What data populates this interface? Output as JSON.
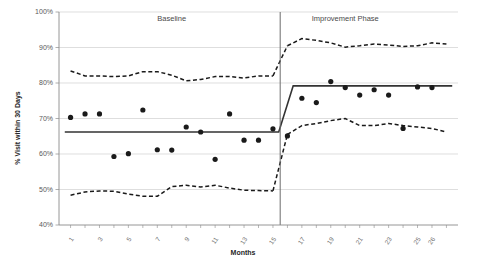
{
  "chart_data": {
    "type": "scatter",
    "title": "",
    "subtitle": "",
    "xlabel": "Months",
    "ylabel": "% Visit within 30 Days",
    "xlim": [
      0.2,
      27.8
    ],
    "ylim": [
      0.4,
      1.0
    ],
    "grid": true,
    "grid_axis": "y",
    "legend": false,
    "y_ticks": [
      0.4,
      0.5,
      0.6,
      0.7,
      0.8,
      0.9,
      1.0
    ],
    "y_tick_labels": [
      "40%",
      "50%",
      "60%",
      "70%",
      "80%",
      "90%",
      "100%"
    ],
    "x_ticks": [
      1,
      3,
      5,
      7,
      9,
      11,
      13,
      15,
      17,
      19,
      21,
      23,
      25,
      26
    ],
    "x_tick_labels": [
      "1",
      "3",
      "5",
      "7",
      "9",
      "11",
      "13",
      "15",
      "17",
      "19",
      "21",
      "23",
      "25",
      "26"
    ],
    "x_minor_ticks": [
      1,
      2,
      3,
      4,
      5,
      6,
      7,
      8,
      9,
      10,
      11,
      12,
      13,
      14,
      15,
      16,
      17,
      18,
      19,
      20,
      21,
      22,
      23,
      24,
      25,
      26,
      27
    ],
    "annotations": [
      {
        "name": "baseline-phase-label",
        "text": "Baseline",
        "x": 8.0,
        "y": 0.975
      },
      {
        "name": "improvement-phase-label",
        "text": "Improvement Phase",
        "x": 20.0,
        "y": 0.975
      }
    ],
    "phase_divider": {
      "name": "phase-divider-line",
      "x": 15.5,
      "color": "#6b6b6b"
    },
    "series": [
      {
        "name": "Observed % visit within 30 days",
        "type": "scatter",
        "marker": "filled-circle",
        "color": "#1a1a1a",
        "x": [
          1,
          2,
          3,
          4,
          5,
          6,
          7,
          8,
          9,
          10,
          11,
          12,
          13,
          14,
          15,
          16,
          17,
          18,
          19,
          20,
          21,
          22,
          23,
          24,
          25,
          26
        ],
        "values": [
          0.703,
          0.713,
          0.713,
          0.593,
          0.601,
          0.724,
          0.612,
          0.611,
          0.676,
          0.662,
          0.585,
          0.713,
          0.639,
          0.639,
          0.671,
          0.651,
          0.757,
          0.745,
          0.804,
          0.787,
          0.766,
          0.781,
          0.766,
          0.672,
          0.789,
          0.787
        ],
        "values_right_extra": [
          0.835,
          0.776,
          0.787,
          0.835
        ]
      },
      {
        "name": "Center line (mean)",
        "type": "step-line",
        "color": "#333333",
        "segments": [
          {
            "label": "baseline-mean",
            "x_start": 0.6,
            "x_end": 15.4,
            "y": 0.662
          },
          {
            "label": "transition",
            "x_start": 15.4,
            "x_end": 16.4,
            "y_start": 0.662,
            "y_end": 0.792
          },
          {
            "label": "improvement-mean",
            "x_start": 16.4,
            "x_end": 27.4,
            "y": 0.792
          }
        ]
      },
      {
        "name": "Upper control limit (UCL)",
        "type": "dashed-line",
        "color": "#1a1a1a",
        "x": [
          1,
          2,
          3,
          4,
          5,
          6,
          7,
          8,
          9,
          10,
          11,
          12,
          13,
          14,
          15,
          16,
          17,
          18,
          19,
          20,
          21,
          22,
          23,
          24,
          25,
          26,
          27
        ],
        "values": [
          0.834,
          0.82,
          0.82,
          0.818,
          0.82,
          0.832,
          0.832,
          0.822,
          0.806,
          0.81,
          0.818,
          0.818,
          0.814,
          0.82,
          0.82,
          0.905,
          0.925,
          0.92,
          0.913,
          0.901,
          0.905,
          0.91,
          0.907,
          0.903,
          0.905,
          0.913,
          0.91
        ]
      },
      {
        "name": "Lower control limit (LCL)",
        "type": "dashed-line",
        "color": "#1a1a1a",
        "x": [
          1,
          2,
          3,
          4,
          5,
          6,
          7,
          8,
          9,
          10,
          11,
          12,
          13,
          14,
          15,
          16,
          17,
          18,
          19,
          20,
          21,
          22,
          23,
          24,
          25,
          26,
          27
        ],
        "values": [
          0.484,
          0.493,
          0.496,
          0.495,
          0.487,
          0.481,
          0.481,
          0.508,
          0.512,
          0.507,
          0.512,
          0.504,
          0.498,
          0.497,
          0.496,
          0.655,
          0.68,
          0.686,
          0.694,
          0.7,
          0.68,
          0.68,
          0.686,
          0.68,
          0.676,
          0.672,
          0.662
        ]
      }
    ]
  },
  "axes": {
    "y_label": "% Visit within 30 Days",
    "x_label": "Months"
  }
}
